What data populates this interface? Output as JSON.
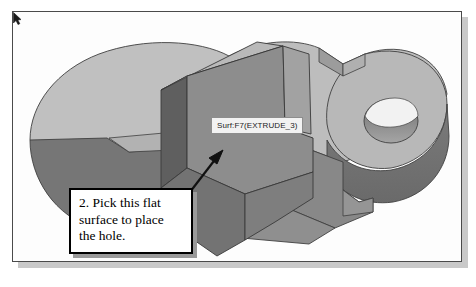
{
  "figure": {
    "kind": "cad-3d-solid-model-illustration",
    "background_color": "#ffffff",
    "frame_border_color": "#4a4a4a",
    "shadow_color": "#c9c9c9"
  },
  "tooltip": {
    "text": "Surf:F7(EXTRUDE_3)",
    "background_color": "#f2f2f2",
    "border_color": "#8d8d8d",
    "text_color": "#1c1c1c"
  },
  "callout": {
    "line1": "2. Pick this flat",
    "line2": "surface to place",
    "line3": "the hole.",
    "border_color": "#000000",
    "background_color": "#ffffff",
    "text_color": "#000000"
  },
  "cursor": {
    "name": "mouse-pointer",
    "color": "#1a1a1a"
  },
  "leader_arrow": {
    "name": "callout-leader-arrow",
    "color": "#111111",
    "points_to": "highlighted-flat-surface"
  },
  "model": {
    "name": "extruded-plate-with-raised-block",
    "shading": {
      "top_light": "#c2c2c2",
      "top_mid": "#b4b4b4",
      "selected_face": "#8d8d8d",
      "side_dark": "#6e6e6e",
      "side_darker": "#5e5e5e",
      "side_mid": "#7d7d7d",
      "hole_inner": "#8a8a8a",
      "hole_highlight": "#f0f0f0",
      "edge": "#3c3c3c"
    },
    "features": [
      "left-rounded-lobe",
      "right-rounded-lobe",
      "through-hole",
      "raised-rectangular-block",
      "step-notch",
      "highlighted-flat-surface"
    ]
  }
}
